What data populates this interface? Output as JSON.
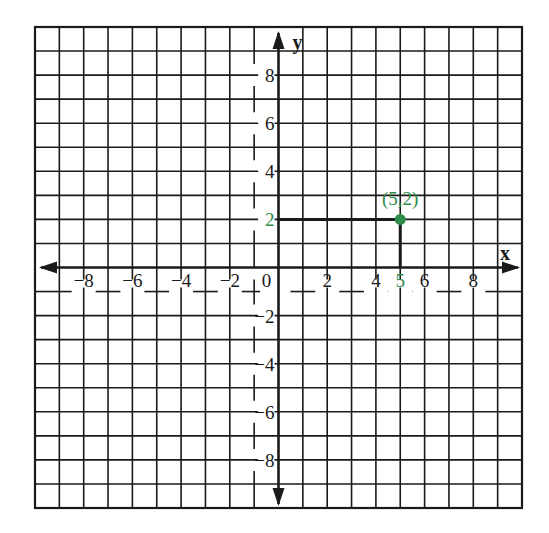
{
  "figure": {
    "x_axis_label": "x",
    "y_axis_label": "y",
    "grid": {
      "cols": 20,
      "rows": 20,
      "min": -10,
      "max": 10
    },
    "x_tick_labels": [
      {
        "value": -8,
        "text": "−8"
      },
      {
        "value": -6,
        "text": "−6"
      },
      {
        "value": -4,
        "text": "−4"
      },
      {
        "value": -2,
        "text": "−2"
      },
      {
        "value": 0,
        "text": "0"
      },
      {
        "value": 2,
        "text": "2"
      },
      {
        "value": 4,
        "text": "4"
      },
      {
        "value": 5,
        "text": "5",
        "highlight": true
      },
      {
        "value": 6,
        "text": "6"
      },
      {
        "value": 8,
        "text": "8"
      }
    ],
    "y_tick_labels": [
      {
        "value": 8,
        "text": "8"
      },
      {
        "value": 6,
        "text": "6"
      },
      {
        "value": 4,
        "text": "4"
      },
      {
        "value": 2,
        "text": "2",
        "highlight": true
      },
      {
        "value": -2,
        "text": "−2"
      },
      {
        "value": -4,
        "text": "−4"
      },
      {
        "value": -6,
        "text": "−6"
      },
      {
        "value": -8,
        "text": "−8"
      }
    ],
    "point": {
      "x": 5,
      "y": 2,
      "label": "(5,2)"
    },
    "colors": {
      "grid": "#1a1a1a",
      "highlight": "#2e8b4a",
      "background": "#ffffff"
    }
  }
}
